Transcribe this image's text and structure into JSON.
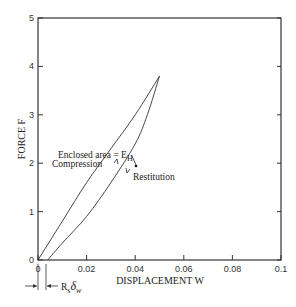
{
  "chart_data": {
    "type": "line",
    "title": "",
    "xlabel": "DISPLACEMENT  W",
    "ylabel": "FORCE  F",
    "xlim": [
      0,
      0.1
    ],
    "ylim": [
      0,
      5
    ],
    "grid": false,
    "x_ticks": [
      "0",
      "0.02",
      "0.04",
      "0.06",
      "0.08",
      "0.1"
    ],
    "y_ticks": [
      "0",
      "1",
      "2",
      "3",
      "4",
      "5"
    ],
    "series": [
      {
        "name": "Compression",
        "x": [
          0,
          0.01,
          0.02,
          0.03,
          0.04,
          0.05
        ],
        "y": [
          0,
          0.8,
          1.6,
          2.3,
          3.0,
          3.8
        ]
      },
      {
        "name": "Restitution",
        "x": [
          0.05,
          0.045,
          0.04,
          0.03,
          0.02,
          0.01,
          0.004
        ],
        "y": [
          3.8,
          3.0,
          2.4,
          1.6,
          0.9,
          0.35,
          0
        ]
      }
    ],
    "annotations": [
      {
        "text": "Enclosed area = E",
        "subscript": "H",
        "x": 0.041,
        "y": 2.55
      },
      {
        "text": "Compression",
        "x": 0.02,
        "y": 2.0
      },
      {
        "text": "Restitution",
        "x": 0.048,
        "y": 1.8
      },
      {
        "text": "R",
        "subscript": "s",
        "suffix": "δ",
        "suffix_sub": "w",
        "note": "offset between origin and restitution end"
      }
    ]
  },
  "labels": {
    "enclosed": "Enclosed area = E",
    "enclosed_sub": "H",
    "compression": "Compression",
    "restitution": "Restitution",
    "rs": "R",
    "rs_sub": "s",
    "delta": "δ",
    "delta_sub": "w"
  }
}
